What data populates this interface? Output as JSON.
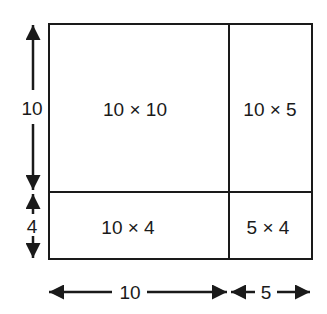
{
  "diagram": {
    "title": "",
    "regions": [
      {
        "id": "top-left",
        "label": "10 × 10"
      },
      {
        "id": "top-right",
        "label": "10 × 5"
      },
      {
        "id": "bottom-left",
        "label": "10 × 4"
      },
      {
        "id": "bottom-right",
        "label": "5 × 4"
      }
    ],
    "dimensions": {
      "left_top": "10",
      "left_bottom": "4",
      "bottom_left": "10",
      "bottom_right": "5"
    },
    "colors": {
      "line": "#1a1a1a",
      "background": "#ffffff"
    }
  }
}
